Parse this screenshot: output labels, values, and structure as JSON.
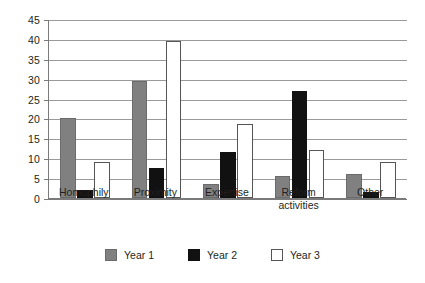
{
  "chart_data": {
    "type": "bar",
    "title": "",
    "subtitle": "",
    "xlabel": "",
    "ylabel": "",
    "categories": [
      "Homophily",
      "Proximity",
      "Expertise",
      "Reform\nactivities",
      "Other"
    ],
    "series": [
      {
        "name": "Year 1",
        "color": "#808080",
        "values": [
          20,
          29.5,
          3.5,
          5.5,
          6
        ]
      },
      {
        "name": "Year 2",
        "color": "#111111",
        "values": [
          2,
          7.5,
          11.5,
          27,
          1.5
        ]
      },
      {
        "name": "Year 3",
        "color": "#ffffff",
        "values": [
          9,
          39.5,
          18.5,
          12,
          9
        ]
      }
    ],
    "ylim": [
      0,
      45
    ],
    "ytick_step": 5,
    "yticks": [
      0,
      5,
      10,
      15,
      20,
      25,
      30,
      35,
      40,
      45
    ],
    "ytick_labels": [
      "0",
      "5",
      "10",
      "15",
      "20",
      "25",
      "30",
      "35",
      "40",
      "45"
    ],
    "grid": true,
    "grid_axis": "y",
    "legend_position": "bottom",
    "annotations": []
  },
  "legend": {
    "items": [
      {
        "label": "Year 1",
        "swatch": "gray-swatch"
      },
      {
        "label": "Year 2",
        "swatch": "black-swatch"
      },
      {
        "label": "Year 3",
        "swatch": "white-swatch"
      }
    ]
  },
  "colors": {
    "series_1": "#808080",
    "series_2": "#111111",
    "series_3": "#ffffff",
    "grid": "#9a9a9a",
    "axis": "#7a7a7a",
    "text": "#231f20",
    "background": "#ffffff"
  }
}
